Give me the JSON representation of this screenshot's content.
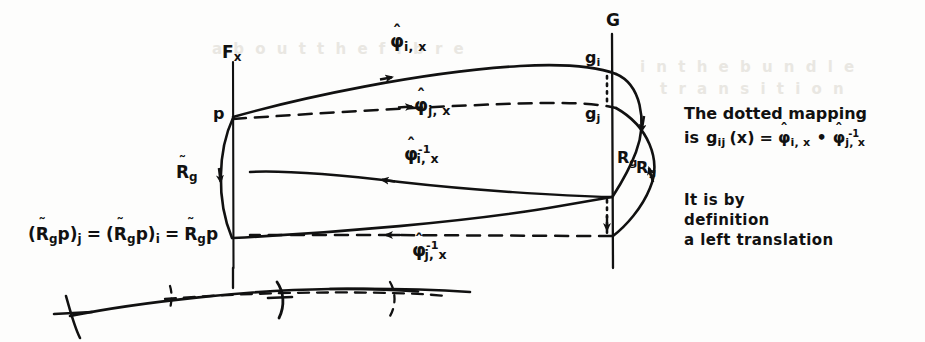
{
  "figure": {
    "kind": "hand-drawn mathematical diagram",
    "background_color": "#fdfdfc",
    "ink_color": "#111111",
    "ghost_color": "#e9e7e2"
  },
  "labels": {
    "fiber_left": "F",
    "fiber_left_sub": "x",
    "point_p": "p",
    "group_G": "G",
    "g_i": "g",
    "g_i_sub": "i",
    "g_j": "g",
    "g_j_sub": "j",
    "phi_hat": "φ",
    "hat_mark": "ˆ",
    "tilde_mark": "˜",
    "sub_ix": "i, x",
    "sub_jx": "j, x",
    "inv": "-1",
    "R_letter": "R",
    "R_sub_g": "g",
    "p_letter": "p",
    "equals": "=",
    "compose_dot": "•",
    "paren_open": "(",
    "paren_close": ")",
    "x_arg": "x",
    "g_ij": "g",
    "g_ij_sub": "ij"
  },
  "arrows": [
    {
      "name": "phi-hat-i-x-forward",
      "style": "solid",
      "direction": "right",
      "label": "φ̂ i,x"
    },
    {
      "name": "phi-hat-j-x-dashed",
      "style": "dashed",
      "direction": "right",
      "label": "φ̂ j,x"
    },
    {
      "name": "phi-hat-i-x-inverse",
      "style": "solid",
      "direction": "left",
      "label": "φ̂ -1 i,x"
    },
    {
      "name": "phi-hat-j-x-inverse",
      "style": "dashed",
      "direction": "left",
      "label": "φ̂ -1 j,x"
    },
    {
      "name": "R-tilde-g-vertical",
      "style": "solid",
      "direction": "down",
      "label": "R̃ g"
    },
    {
      "name": "R-g-right-upper",
      "style": "solid",
      "direction": "down",
      "label": "R g"
    },
    {
      "name": "R-g-right-lower",
      "style": "solid",
      "direction": "up",
      "label": "R g"
    }
  ],
  "equations": {
    "bottom_left": {
      "full_text": "( R̃ g p )_j = ( R̃ g p )_i = R̃ g p",
      "parts": [
        "(",
        "R",
        "g",
        "p",
        ")",
        "j",
        "=",
        "(",
        "R",
        "g",
        "p",
        ")",
        "i",
        "=",
        "R",
        "g",
        "p"
      ]
    },
    "dotted_mapping": {
      "line1": "The dotted mapping",
      "line2_prefix": "is",
      "line2_full": "is g_ij (x) = φ̂_i,x • φ̂^-1_j,x"
    }
  },
  "notes": {
    "left_translation": {
      "line1": "It is by",
      "line2": "definition",
      "line3": "a left translation"
    }
  },
  "ghost_text": {
    "row1": "a  b  o  u  t   t h e   f i b r e",
    "row2": "i n   t h e   b u n d l e",
    "row3": "t r a n s i t i o n"
  }
}
